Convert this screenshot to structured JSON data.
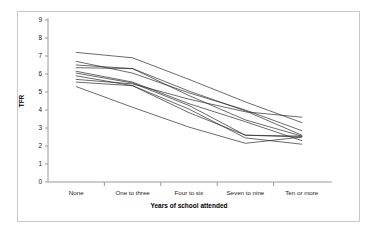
{
  "chart_data": {
    "type": "line",
    "title": "",
    "xlabel": "Years of school attended",
    "ylabel": "TFR",
    "categories": [
      "None",
      "One to three",
      "Four to six",
      "Seven to nine",
      "Ten or more"
    ],
    "ylim": [
      0,
      9
    ],
    "yticks": [
      0,
      1,
      2,
      3,
      4,
      5,
      6,
      7,
      8,
      9
    ],
    "grid": false,
    "legend": "none",
    "series": [
      {
        "name": "series-1",
        "values": [
          7.2,
          6.9,
          5.7,
          4.45,
          3.3
        ]
      },
      {
        "name": "series-2",
        "values": [
          6.7,
          6.05,
          4.95,
          4.0,
          2.85
        ]
      },
      {
        "name": "series-3",
        "values": [
          6.5,
          6.3,
          4.8,
          3.45,
          2.55
        ]
      },
      {
        "name": "series-4",
        "values": [
          6.35,
          6.3,
          5.05,
          3.95,
          2.6
        ]
      },
      {
        "name": "series-5",
        "values": [
          6.15,
          5.55,
          4.35,
          3.35,
          2.3
        ]
      },
      {
        "name": "series-6",
        "values": [
          6.05,
          5.5,
          4.25,
          2.6,
          2.5
        ]
      },
      {
        "name": "series-7",
        "values": [
          5.9,
          5.35,
          3.85,
          2.6,
          2.55
        ]
      },
      {
        "name": "series-8",
        "values": [
          5.7,
          5.45,
          4.6,
          3.9,
          3.6
        ]
      },
      {
        "name": "series-9",
        "values": [
          5.55,
          5.35,
          4.05,
          2.45,
          2.1
        ]
      },
      {
        "name": "series-10",
        "values": [
          5.3,
          4.15,
          3.05,
          2.15,
          2.5
        ]
      }
    ]
  }
}
